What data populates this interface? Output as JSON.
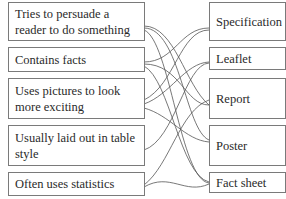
{
  "diagram": {
    "type": "matching-exercise",
    "left_items": [
      {
        "id": "L1",
        "text": "Tries to persuade a reader to do something"
      },
      {
        "id": "L2",
        "text": "Contains facts"
      },
      {
        "id": "L3",
        "text": "Uses pictures to look more exciting"
      },
      {
        "id": "L4",
        "text": "Usually laid out in table style"
      },
      {
        "id": "L5",
        "text": "Often uses statistics"
      }
    ],
    "right_items": [
      {
        "id": "R1",
        "text": "Specification"
      },
      {
        "id": "R2",
        "text": "Leaflet"
      },
      {
        "id": "R3",
        "text": "Report"
      },
      {
        "id": "R4",
        "text": "Poster"
      },
      {
        "id": "R5",
        "text": "Fact sheet"
      }
    ],
    "line_color": "#555555",
    "border_color": "#7a7a7a"
  }
}
